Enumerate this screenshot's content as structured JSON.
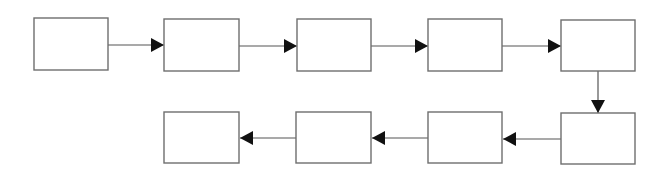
{
  "diagram": {
    "type": "flowchart",
    "colors": {
      "box_stroke": "#6e6e6e",
      "box_fill": "#ffffff",
      "edge": "#555555",
      "arrowhead": "#111111",
      "background": "#ffffff"
    },
    "nodes": [
      {
        "id": "n1",
        "label": "",
        "x": 34,
        "y": 18,
        "w": 74,
        "h": 52
      },
      {
        "id": "n2",
        "label": "",
        "x": 164,
        "y": 19,
        "w": 75,
        "h": 52
      },
      {
        "id": "n3",
        "label": "",
        "x": 297,
        "y": 19,
        "w": 74,
        "h": 52
      },
      {
        "id": "n4",
        "label": "",
        "x": 428,
        "y": 19,
        "w": 74,
        "h": 52
      },
      {
        "id": "n5",
        "label": "",
        "x": 561,
        "y": 20,
        "w": 74,
        "h": 51
      },
      {
        "id": "n6",
        "label": "",
        "x": 561,
        "y": 113,
        "w": 74,
        "h": 51
      },
      {
        "id": "n7",
        "label": "",
        "x": 428,
        "y": 112,
        "w": 74,
        "h": 51
      },
      {
        "id": "n8",
        "label": "",
        "x": 296,
        "y": 112,
        "w": 75,
        "h": 51
      },
      {
        "id": "n9",
        "label": "",
        "x": 164,
        "y": 112,
        "w": 75,
        "h": 51
      }
    ],
    "edges": [
      {
        "from": "n1",
        "to": "n2",
        "direction": "right"
      },
      {
        "from": "n2",
        "to": "n3",
        "direction": "right"
      },
      {
        "from": "n3",
        "to": "n4",
        "direction": "right"
      },
      {
        "from": "n4",
        "to": "n5",
        "direction": "right"
      },
      {
        "from": "n5",
        "to": "n6",
        "direction": "down"
      },
      {
        "from": "n6",
        "to": "n7",
        "direction": "left"
      },
      {
        "from": "n7",
        "to": "n8",
        "direction": "left"
      },
      {
        "from": "n8",
        "to": "n9",
        "direction": "left"
      }
    ]
  }
}
